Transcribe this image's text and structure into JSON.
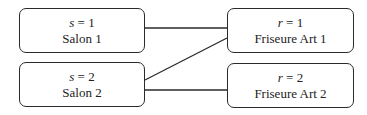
{
  "nodes": {
    "s1": {
      "var": "s",
      "eq": " = 1",
      "label": "Salon 1"
    },
    "s2": {
      "var": "s",
      "eq": " = 2",
      "label": "Salon 2"
    },
    "r1": {
      "var": "r",
      "eq": " = 1",
      "label": "Friseure Art 1"
    },
    "r2": {
      "var": "r",
      "eq": " = 2",
      "label": "Friseure Art 2"
    }
  },
  "edges": [
    {
      "from": "s1",
      "to": "r1"
    },
    {
      "from": "s2",
      "to": "r1"
    },
    {
      "from": "s2",
      "to": "r2"
    }
  ]
}
